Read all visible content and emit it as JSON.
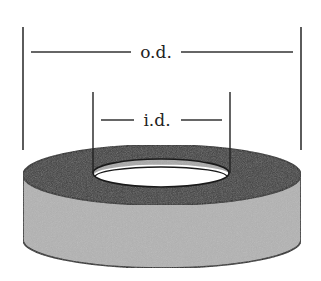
{
  "diagram": {
    "labels": {
      "outer_diameter": "o.d.",
      "inner_diameter": "i.d."
    },
    "colors": {
      "background": "#ffffff",
      "top_face": "#3a3a3a",
      "side_wall": "#b3b3b3",
      "inner_wall": "#a8a8a8",
      "hole": "#ffffff",
      "outline": "#1a1a1a",
      "dimension_lines": "#333333"
    }
  }
}
